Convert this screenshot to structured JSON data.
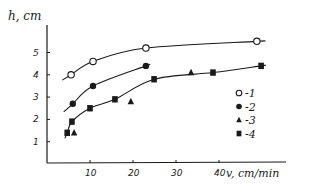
{
  "chart_data": {
    "type": "scatter",
    "title": "",
    "xlabel": "v, cm/min",
    "ylabel": "h, cm",
    "xlim": [
      0,
      52
    ],
    "ylim": [
      0,
      6
    ],
    "xticks": [
      10,
      20,
      30,
      40
    ],
    "yticks": [
      1,
      2,
      3,
      4,
      5
    ],
    "grid": false,
    "legend_position": "right-middle",
    "colors": {
      "ink": "#1a1a1a",
      "background": "#ffffff"
    },
    "series": [
      {
        "name": "1",
        "legend": "-1",
        "marker": "open-circle",
        "fitted_curve": true,
        "x": [
          5.6,
          10.7,
          23,
          48.8
        ],
        "y": [
          4.0,
          4.6,
          5.2,
          5.5
        ]
      },
      {
        "name": "2",
        "legend": "-2",
        "marker": "filled-circle",
        "fitted_curve": true,
        "x": [
          6,
          10.7,
          23
        ],
        "y": [
          2.7,
          3.5,
          4.4
        ]
      },
      {
        "name": "3",
        "legend": "-3",
        "marker": "triangle",
        "fitted_curve": false,
        "x": [
          6.3,
          19.5,
          33.5
        ],
        "y": [
          1.4,
          2.8,
          4.1
        ]
      },
      {
        "name": "4",
        "legend": "-4",
        "marker": "filled-square",
        "fitted_curve": true,
        "x": [
          4.7,
          5.8,
          10,
          15.8,
          24.9,
          38.6,
          49.8
        ],
        "y": [
          1.4,
          1.9,
          2.5,
          2.9,
          3.8,
          4.1,
          4.4
        ]
      }
    ]
  }
}
